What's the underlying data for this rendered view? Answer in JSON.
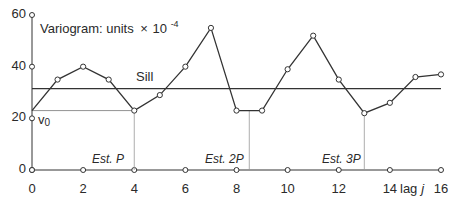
{
  "chart_data": {
    "type": "line",
    "title_main": "Variogram:  units",
    "title_times": "×",
    "title_base": "10",
    "title_exp": "-4",
    "xlabel": "lag j",
    "xlabel_text": "lag",
    "xlabel_var": "j",
    "ylabel": "",
    "xlim": [
      0,
      16
    ],
    "ylim": [
      0,
      60
    ],
    "x_ticks": [
      0,
      2,
      4,
      6,
      8,
      10,
      12,
      14,
      16
    ],
    "y_ticks": [
      0,
      20,
      40,
      60
    ],
    "grid": false,
    "series": [
      {
        "name": "Variogram",
        "x": [
          0,
          1,
          2,
          3,
          4,
          5,
          6,
          7,
          8,
          9,
          10,
          11,
          12,
          13,
          14,
          15,
          16
        ],
        "values": [
          23,
          35,
          40,
          35,
          23,
          29,
          40,
          55,
          23,
          23,
          39,
          52,
          35,
          22,
          26,
          36,
          37
        ]
      }
    ],
    "reference_lines": {
      "sill": {
        "label": "Sill",
        "value": 31.5
      },
      "v0": {
        "label": "v₀",
        "value": 23
      }
    },
    "annotations": [
      {
        "label": "Est. P",
        "x": 4
      },
      {
        "label": "Est. 2P",
        "x": 8.5
      },
      {
        "label": "Est. 3P",
        "x": 13
      }
    ]
  },
  "labels": {
    "sill": "Sill",
    "v0_base": "v",
    "v0_sub": "0",
    "est_p": "Est. P",
    "est_2p": "Est. 2P",
    "est_3p": "Est. 3P"
  }
}
